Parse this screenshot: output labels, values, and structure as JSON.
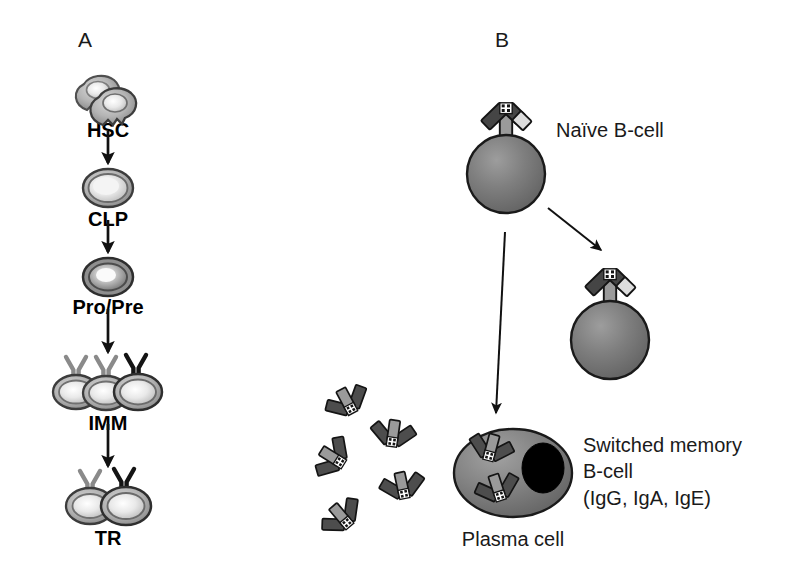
{
  "figure": {
    "width": 789,
    "height": 572,
    "background": "#ffffff"
  },
  "panels": {
    "a": {
      "letter": "A",
      "letter_pos": {
        "x": 78,
        "y": 28
      },
      "stages": [
        {
          "id": "hsc",
          "label": "HSC",
          "label_pos": {
            "x": 108,
            "y": 119
          },
          "cell_type": "lobed-pair",
          "cell_center": {
            "x": 107,
            "y": 98
          },
          "receptors": 0,
          "note": "two overlapping scalloped haematopoietic stem cells"
        },
        {
          "id": "clp",
          "label": "CLP",
          "label_pos": {
            "x": 108,
            "y": 208
          },
          "cell_type": "single-oval-light",
          "cell_center": {
            "x": 108,
            "y": 188
          },
          "receptors": 0,
          "note": "common lymphoid progenitor"
        },
        {
          "id": "propre",
          "label": "Pro/Pre",
          "label_pos": {
            "x": 108,
            "y": 296
          },
          "cell_type": "single-oval-dark",
          "cell_center": {
            "x": 108,
            "y": 277
          },
          "receptors": 0,
          "note": "pro/pre B-cell, darker rim"
        },
        {
          "id": "imm",
          "label": "IMM",
          "label_pos": {
            "x": 108,
            "y": 412
          },
          "cell_type": "triple-oval",
          "cell_center": {
            "x": 108,
            "y": 390
          },
          "receptors": 3,
          "receptor_colors": [
            "#8a8a8a",
            "#8a8a8a",
            "#141414"
          ],
          "note": "immature B-cells, third receptor dark"
        },
        {
          "id": "tr",
          "label": "TR",
          "label_pos": {
            "x": 108,
            "y": 527
          },
          "cell_type": "double-oval",
          "cell_center": {
            "x": 108,
            "y": 503
          },
          "receptors": 2,
          "receptor_colors": [
            "#8a8a8a",
            "#141414"
          ],
          "note": "transitional B-cells"
        }
      ],
      "arrows": [
        {
          "from": {
            "x": 108,
            "y": 130
          },
          "to": {
            "x": 108,
            "y": 163
          }
        },
        {
          "from": {
            "x": 108,
            "y": 219
          },
          "to": {
            "x": 108,
            "y": 252
          }
        },
        {
          "from": {
            "x": 108,
            "y": 307
          },
          "to": {
            "x": 108,
            "y": 352
          }
        },
        {
          "from": {
            "x": 108,
            "y": 423
          },
          "to": {
            "x": 108,
            "y": 466
          }
        }
      ]
    },
    "b": {
      "letter": "B",
      "letter_pos": {
        "x": 495,
        "y": 28
      },
      "cells": [
        {
          "id": "naive-b-cell",
          "label": "Naïve B-cell",
          "label_pos": {
            "x": 556,
            "y": 117
          },
          "shape": "sphere",
          "center": {
            "x": 506,
            "y": 174
          },
          "radius": 39,
          "receptor": {
            "x": 506,
            "y": 135,
            "angle": 0
          }
        },
        {
          "id": "switched-memory-b-cell",
          "label_lines": [
            "Switched memory",
            "B-cell",
            "(IgG, IgA, IgE)"
          ],
          "label_pos": {
            "x": 583,
            "y": 432
          },
          "shape": "sphere",
          "center": {
            "x": 610,
            "y": 340
          },
          "radius": 39,
          "receptor": {
            "x": 610,
            "y": 301,
            "angle": 0
          }
        },
        {
          "id": "plasma-cell",
          "label": "Plasma cell",
          "label_pos": {
            "x": 513,
            "y": 526
          },
          "shape": "ellipse",
          "center": {
            "x": 513,
            "y": 473
          },
          "rx": 59,
          "ry": 44,
          "nucleus": {
            "cx": 541,
            "cy": 468,
            "rx": 21,
            "ry": 25,
            "color": "#000000"
          },
          "internal_antibodies": 2
        }
      ],
      "secreted_antibodies": [
        {
          "x": 351,
          "y": 409,
          "rotate": 152
        },
        {
          "x": 392,
          "y": 442,
          "rotate": 188
        },
        {
          "x": 340,
          "y": 462,
          "rotate": 122
        },
        {
          "x": 404,
          "y": 494,
          "rotate": 168
        },
        {
          "x": 347,
          "y": 523,
          "rotate": 140
        }
      ],
      "arrows": [
        {
          "id": "naive-to-memory",
          "from": {
            "x": 545,
            "y": 209
          },
          "to": {
            "x": 600,
            "y": 252
          }
        },
        {
          "id": "naive-to-plasma",
          "from": {
            "x": 504,
            "y": 230
          },
          "to": {
            "x": 496,
            "y": 415
          }
        }
      ]
    }
  },
  "colors": {
    "cell_fill_dark": "#6e6e6e",
    "cell_fill_mid": "#8f8f8f",
    "cell_fill_light": "#dcdcdc",
    "cell_highlight": "#ffffff",
    "outline": "#1a1a1a",
    "receptor_dark": "#4a4a4a",
    "receptor_light": "#d4d4d4",
    "nucleus": "#000000",
    "text": "#1a1a1a",
    "background": "#ffffff"
  }
}
